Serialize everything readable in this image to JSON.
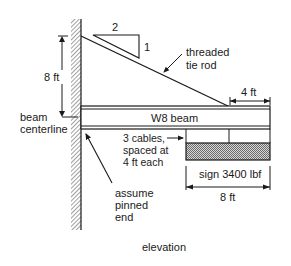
{
  "diagram": {
    "view_label": "elevation",
    "slope": {
      "run": "2",
      "rise": "1"
    },
    "tie_rod": {
      "line1": "threaded",
      "line2": "tie rod"
    },
    "height_dim": "8 ft",
    "offset_dim": "4 ft",
    "beam_label": "W8 beam",
    "centerline": {
      "line1": "beam",
      "line2": "centerline"
    },
    "cables": {
      "line1": "3 cables,",
      "line2": "spaced at",
      "line3": "4 ft each"
    },
    "sign_label": "sign 3400 lbf",
    "sign_width_dim": "8 ft",
    "support": {
      "line1": "assume",
      "line2": "pinned",
      "line3": "end"
    }
  },
  "colors": {
    "ink": "#1a1a1a",
    "hatch": "#555555",
    "background": "#ffffff"
  }
}
